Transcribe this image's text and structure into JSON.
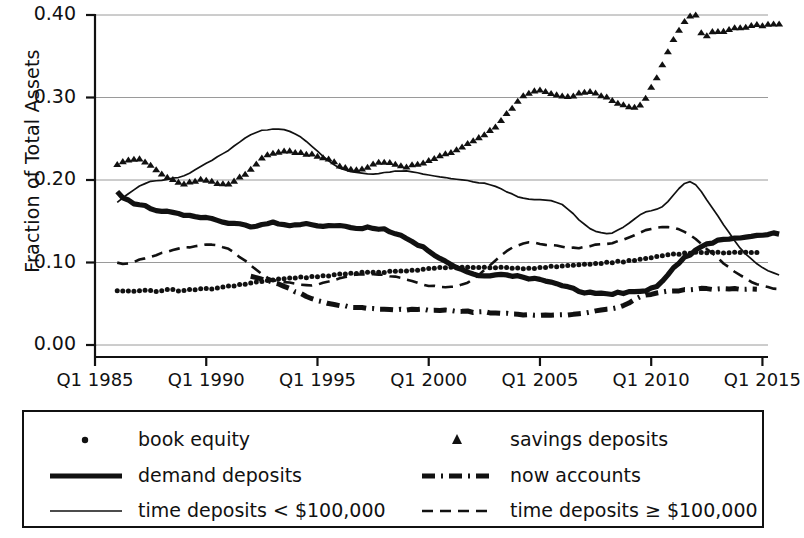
{
  "chart_data": {
    "type": "line",
    "title": "",
    "xlabel": "",
    "ylabel": "Fraction of Total Assets",
    "xlim": [
      1985.0,
      2015.25
    ],
    "ylim": [
      0.0,
      0.4
    ],
    "grid": true,
    "legend_position": "bottom",
    "ytick_labels": [
      "0.40",
      "0.30",
      "0.20",
      "0.10",
      "0.00"
    ],
    "ytick_values": [
      0.4,
      0.3,
      0.2,
      0.1,
      0.0
    ],
    "xtick_labels": [
      "Q1 1985",
      "Q1 1990",
      "Q1 1995",
      "Q1 2000",
      "Q1 2005",
      "Q1 2010",
      "Q1 2015"
    ],
    "xtick_values": [
      1985,
      1990,
      1995,
      2000,
      2005,
      2010,
      2015
    ],
    "x_start": 1986.0,
    "x_step": 0.25,
    "series": [
      {
        "name": "book equity",
        "style": "dotted-markers",
        "color": "#111111",
        "x_start": 1986.0,
        "values": [
          0.066,
          0.066,
          0.065,
          0.065,
          0.066,
          0.066,
          0.066,
          0.065,
          0.066,
          0.067,
          0.067,
          0.066,
          0.066,
          0.067,
          0.067,
          0.068,
          0.068,
          0.068,
          0.069,
          0.07,
          0.071,
          0.072,
          0.073,
          0.074,
          0.075,
          0.076,
          0.077,
          0.078,
          0.079,
          0.08,
          0.08,
          0.081,
          0.081,
          0.082,
          0.082,
          0.083,
          0.083,
          0.084,
          0.084,
          0.085,
          0.086,
          0.086,
          0.087,
          0.087,
          0.088,
          0.088,
          0.088,
          0.088,
          0.088,
          0.089,
          0.089,
          0.09,
          0.09,
          0.091,
          0.091,
          0.092,
          0.093,
          0.093,
          0.094,
          0.094,
          0.094,
          0.094,
          0.094,
          0.094,
          0.094,
          0.094,
          0.094,
          0.094,
          0.094,
          0.094,
          0.094,
          0.093,
          0.093,
          0.093,
          0.093,
          0.093,
          0.094,
          0.094,
          0.095,
          0.095,
          0.096,
          0.096,
          0.097,
          0.097,
          0.098,
          0.098,
          0.099,
          0.099,
          0.1,
          0.1,
          0.101,
          0.101,
          0.102,
          0.103,
          0.104,
          0.105,
          0.106,
          0.107,
          0.108,
          0.109,
          0.11,
          0.11,
          0.111,
          0.111,
          0.112,
          0.112,
          0.112,
          0.112,
          0.112,
          0.112,
          0.112,
          0.112,
          0.112,
          0.112,
          0.112,
          0.112
        ]
      },
      {
        "name": "savings deposits",
        "style": "triangle-markers",
        "color": "#111111",
        "x_start": 1986.0,
        "values": [
          0.218,
          0.222,
          0.224,
          0.226,
          0.225,
          0.222,
          0.218,
          0.212,
          0.207,
          0.203,
          0.2,
          0.198,
          0.196,
          0.197,
          0.199,
          0.201,
          0.2,
          0.198,
          0.196,
          0.195,
          0.196,
          0.199,
          0.203,
          0.208,
          0.214,
          0.22,
          0.226,
          0.23,
          0.233,
          0.234,
          0.235,
          0.235,
          0.234,
          0.233,
          0.232,
          0.231,
          0.23,
          0.228,
          0.225,
          0.222,
          0.218,
          0.215,
          0.213,
          0.212,
          0.214,
          0.216,
          0.219,
          0.221,
          0.222,
          0.221,
          0.22,
          0.218,
          0.217,
          0.218,
          0.219,
          0.221,
          0.224,
          0.227,
          0.23,
          0.232,
          0.234,
          0.237,
          0.24,
          0.244,
          0.248,
          0.252,
          0.256,
          0.26,
          0.265,
          0.272,
          0.28,
          0.288,
          0.296,
          0.302,
          0.306,
          0.308,
          0.309,
          0.308,
          0.306,
          0.304,
          0.303,
          0.302,
          0.303,
          0.305,
          0.306,
          0.307,
          0.306,
          0.303,
          0.3,
          0.297,
          0.294,
          0.292,
          0.29,
          0.289,
          0.292,
          0.3,
          0.312,
          0.325,
          0.34,
          0.355,
          0.37,
          0.382,
          0.392,
          0.398,
          0.4,
          0.378,
          0.376,
          0.38,
          0.381,
          0.38,
          0.382,
          0.384,
          0.385,
          0.386,
          0.387,
          0.388,
          0.388,
          0.389,
          0.389,
          0.39
        ]
      },
      {
        "name": "demand deposits",
        "style": "thick-solid",
        "color": "#111111",
        "x_start": 1986.0,
        "values": [
          0.185,
          0.178,
          0.175,
          0.172,
          0.17,
          0.168,
          0.166,
          0.164,
          0.163,
          0.162,
          0.16,
          0.159,
          0.158,
          0.157,
          0.156,
          0.155,
          0.154,
          0.153,
          0.151,
          0.15,
          0.148,
          0.147,
          0.146,
          0.145,
          0.144,
          0.145,
          0.146,
          0.147,
          0.148,
          0.147,
          0.146,
          0.145,
          0.145,
          0.146,
          0.147,
          0.146,
          0.145,
          0.144,
          0.144,
          0.145,
          0.145,
          0.144,
          0.143,
          0.142,
          0.142,
          0.143,
          0.142,
          0.141,
          0.14,
          0.138,
          0.135,
          0.132,
          0.129,
          0.126,
          0.122,
          0.118,
          0.114,
          0.11,
          0.106,
          0.102,
          0.098,
          0.094,
          0.091,
          0.088,
          0.086,
          0.085,
          0.084,
          0.085,
          0.086,
          0.086,
          0.085,
          0.084,
          0.083,
          0.082,
          0.081,
          0.08,
          0.079,
          0.078,
          0.076,
          0.074,
          0.072,
          0.07,
          0.068,
          0.066,
          0.064,
          0.063,
          0.062,
          0.062,
          0.062,
          0.062,
          0.063,
          0.063,
          0.064,
          0.064,
          0.065,
          0.066,
          0.068,
          0.072,
          0.078,
          0.086,
          0.094,
          0.1,
          0.106,
          0.11,
          0.115,
          0.119,
          0.122,
          0.124,
          0.126,
          0.127,
          0.128,
          0.129,
          0.13,
          0.131,
          0.132,
          0.133,
          0.134,
          0.134,
          0.135,
          0.135
        ]
      },
      {
        "name": "now accounts",
        "style": "dash-dot-thick",
        "color": "#111111",
        "x_start": 1992.0,
        "values": [
          0.084,
          0.082,
          0.08,
          0.078,
          0.076,
          0.074,
          0.071,
          0.068,
          0.065,
          0.062,
          0.059,
          0.056,
          0.054,
          0.052,
          0.05,
          0.049,
          0.048,
          0.047,
          0.046,
          0.045,
          0.045,
          0.044,
          0.044,
          0.044,
          0.043,
          0.043,
          0.043,
          0.043,
          0.043,
          0.043,
          0.043,
          0.043,
          0.042,
          0.042,
          0.042,
          0.042,
          0.042,
          0.041,
          0.041,
          0.041,
          0.04,
          0.04,
          0.04,
          0.039,
          0.039,
          0.038,
          0.038,
          0.038,
          0.037,
          0.037,
          0.037,
          0.036,
          0.036,
          0.036,
          0.036,
          0.036,
          0.036,
          0.036,
          0.037,
          0.038,
          0.039,
          0.04,
          0.041,
          0.042,
          0.043,
          0.044,
          0.046,
          0.048,
          0.051,
          0.055,
          0.058,
          0.06,
          0.062,
          0.063,
          0.064,
          0.065,
          0.066,
          0.066,
          0.067,
          0.067,
          0.068,
          0.068,
          0.068,
          0.068,
          0.068,
          0.068,
          0.068,
          0.068,
          0.068,
          0.068,
          0.068,
          0.068
        ]
      },
      {
        "name": "time deposits < $100,000",
        "style": "thin-solid",
        "color": "#111111",
        "x_start": 1986.0,
        "values": [
          0.173,
          0.178,
          0.183,
          0.188,
          0.193,
          0.196,
          0.198,
          0.199,
          0.2,
          0.201,
          0.202,
          0.203,
          0.205,
          0.208,
          0.212,
          0.216,
          0.22,
          0.224,
          0.228,
          0.232,
          0.236,
          0.241,
          0.246,
          0.251,
          0.255,
          0.258,
          0.26,
          0.261,
          0.262,
          0.262,
          0.261,
          0.259,
          0.256,
          0.252,
          0.247,
          0.241,
          0.235,
          0.229,
          0.223,
          0.218,
          0.214,
          0.212,
          0.21,
          0.209,
          0.208,
          0.207,
          0.207,
          0.208,
          0.209,
          0.21,
          0.211,
          0.211,
          0.211,
          0.21,
          0.209,
          0.207,
          0.206,
          0.205,
          0.204,
          0.203,
          0.202,
          0.201,
          0.2,
          0.199,
          0.198,
          0.197,
          0.196,
          0.194,
          0.192,
          0.189,
          0.186,
          0.183,
          0.18,
          0.178,
          0.177,
          0.176,
          0.176,
          0.176,
          0.175,
          0.173,
          0.17,
          0.165,
          0.159,
          0.152,
          0.146,
          0.141,
          0.138,
          0.136,
          0.135,
          0.136,
          0.139,
          0.143,
          0.148,
          0.153,
          0.158,
          0.161,
          0.163,
          0.165,
          0.168,
          0.174,
          0.182,
          0.19,
          0.196,
          0.198,
          0.194,
          0.186,
          0.176,
          0.166,
          0.156,
          0.146,
          0.136,
          0.126,
          0.117,
          0.11,
          0.104,
          0.098,
          0.094,
          0.09,
          0.087,
          0.085
        ]
      },
      {
        "name": "time deposits ≥ $100,000",
        "style": "dashed",
        "color": "#111111",
        "x_start": 1986.0,
        "values": [
          0.1,
          0.098,
          0.099,
          0.101,
          0.103,
          0.105,
          0.107,
          0.109,
          0.111,
          0.113,
          0.115,
          0.117,
          0.118,
          0.119,
          0.12,
          0.121,
          0.122,
          0.122,
          0.121,
          0.119,
          0.116,
          0.112,
          0.107,
          0.102,
          0.096,
          0.091,
          0.086,
          0.082,
          0.079,
          0.077,
          0.076,
          0.075,
          0.074,
          0.073,
          0.072,
          0.072,
          0.073,
          0.075,
          0.077,
          0.079,
          0.081,
          0.083,
          0.084,
          0.085,
          0.086,
          0.086,
          0.086,
          0.086,
          0.085,
          0.084,
          0.083,
          0.081,
          0.079,
          0.077,
          0.075,
          0.073,
          0.072,
          0.071,
          0.07,
          0.07,
          0.07,
          0.071,
          0.073,
          0.076,
          0.08,
          0.085,
          0.091,
          0.097,
          0.103,
          0.109,
          0.114,
          0.118,
          0.121,
          0.123,
          0.124,
          0.124,
          0.123,
          0.122,
          0.121,
          0.12,
          0.119,
          0.118,
          0.118,
          0.118,
          0.119,
          0.12,
          0.121,
          0.122,
          0.123,
          0.124,
          0.126,
          0.128,
          0.13,
          0.133,
          0.136,
          0.139,
          0.141,
          0.142,
          0.143,
          0.143,
          0.142,
          0.14,
          0.137,
          0.133,
          0.128,
          0.123,
          0.117,
          0.111,
          0.105,
          0.099,
          0.094,
          0.089,
          0.085,
          0.081,
          0.077,
          0.074,
          0.072,
          0.07,
          0.069,
          0.068
        ]
      }
    ]
  },
  "axes": {
    "ylabel": "Fraction of Total Assets"
  },
  "legend": {
    "entries": [
      {
        "label": "book equity",
        "key": "dotted-markers"
      },
      {
        "label": "savings deposits",
        "key": "triangle-markers"
      },
      {
        "label": "demand deposits",
        "key": "thick-solid"
      },
      {
        "label": "now accounts",
        "key": "dash-dot-thick"
      },
      {
        "label": "time deposits < $100,000",
        "key": "thin-solid"
      },
      {
        "label": "time deposits ≥ $100,000",
        "key": "dashed"
      }
    ]
  },
  "colors": {
    "ink": "#111111",
    "grid": "#9a9a9a",
    "background": "#ffffff"
  }
}
